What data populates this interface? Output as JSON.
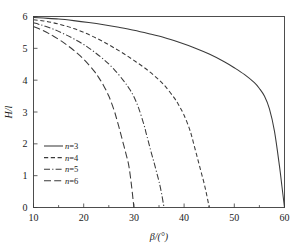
{
  "chart_data": {
    "type": "line",
    "title": "",
    "subtitle": "",
    "xlabel": "β/(°)",
    "ylabel": "H/l",
    "xlim": [
      10,
      60
    ],
    "ylim": [
      0,
      6
    ],
    "xticks": [
      10,
      20,
      30,
      40,
      50,
      60
    ],
    "xtick_labels": [
      "10",
      "20",
      "30",
      "40",
      "50",
      "60"
    ],
    "xminorticks": [
      15,
      25,
      35,
      45,
      55
    ],
    "yticks": [
      0,
      1,
      2,
      3,
      4,
      5,
      6
    ],
    "ytick_labels": [
      "0",
      "1",
      "2",
      "3",
      "4",
      "5",
      "6"
    ],
    "grid": false,
    "legend_position": "left-center",
    "legend_entries": [
      {
        "label": "n=3",
        "style": "solid"
      },
      {
        "label": "n=4",
        "style": "dashed"
      },
      {
        "label": "n=5",
        "style": "dash-dot"
      },
      {
        "label": "n=6",
        "style": "long-dash"
      }
    ],
    "series": [
      {
        "name": "n=3",
        "style": "solid",
        "x": [
          10,
          12,
          15,
          18,
          21,
          24,
          27,
          30,
          33,
          36,
          39,
          42,
          45,
          48,
          50,
          52,
          54,
          55,
          56,
          57,
          58,
          59,
          59.5,
          60
        ],
        "y": [
          5.97,
          5.95,
          5.92,
          5.87,
          5.81,
          5.74,
          5.66,
          5.57,
          5.46,
          5.34,
          5.19,
          5.02,
          4.82,
          4.58,
          4.39,
          4.18,
          3.92,
          3.74,
          3.5,
          3.1,
          2.4,
          1.3,
          0.65,
          0.0
        ]
      },
      {
        "name": "n=4",
        "style": "dashed",
        "x": [
          10,
          12,
          14,
          16,
          18,
          20,
          22,
          24,
          26,
          28,
          30,
          32,
          34,
          36,
          38,
          39,
          40,
          41,
          41.5,
          42,
          42.5,
          43,
          43.5,
          44,
          44.5,
          45
        ],
        "y": [
          5.9,
          5.86,
          5.8,
          5.72,
          5.62,
          5.5,
          5.36,
          5.2,
          5.02,
          4.83,
          4.62,
          4.4,
          4.15,
          3.85,
          3.45,
          3.2,
          2.9,
          2.5,
          2.25,
          1.95,
          1.65,
          1.35,
          1.05,
          0.75,
          0.4,
          0.0
        ]
      },
      {
        "name": "n=5",
        "style": "dash-dot",
        "x": [
          10,
          11,
          12,
          14,
          16,
          18,
          20,
          22,
          24,
          26,
          28,
          29,
          30,
          31,
          32,
          32.5,
          33,
          33.5,
          34,
          34.5,
          35,
          35.5,
          36
        ],
        "y": [
          5.8,
          5.76,
          5.71,
          5.6,
          5.46,
          5.3,
          5.12,
          4.9,
          4.65,
          4.35,
          3.97,
          3.75,
          3.48,
          3.1,
          2.6,
          2.3,
          2.0,
          1.7,
          1.42,
          1.12,
          0.82,
          0.45,
          0.0
        ]
      },
      {
        "name": "n=6",
        "style": "long-dash",
        "x": [
          10,
          11,
          12,
          13,
          14,
          16,
          18,
          20,
          22,
          23,
          24,
          25,
          26,
          26.5,
          27,
          27.5,
          28,
          28.5,
          29,
          29.5,
          30
        ],
        "y": [
          5.68,
          5.62,
          5.55,
          5.47,
          5.38,
          5.18,
          4.94,
          4.66,
          4.3,
          4.08,
          3.82,
          3.5,
          3.08,
          2.82,
          2.54,
          2.24,
          1.94,
          1.64,
          1.3,
          0.72,
          0.0
        ]
      }
    ],
    "colors": {
      "curve": "#3a3a3a",
      "frame": "#3b3b3b",
      "text": "#1a1a1a",
      "background": "#ffffff"
    }
  }
}
